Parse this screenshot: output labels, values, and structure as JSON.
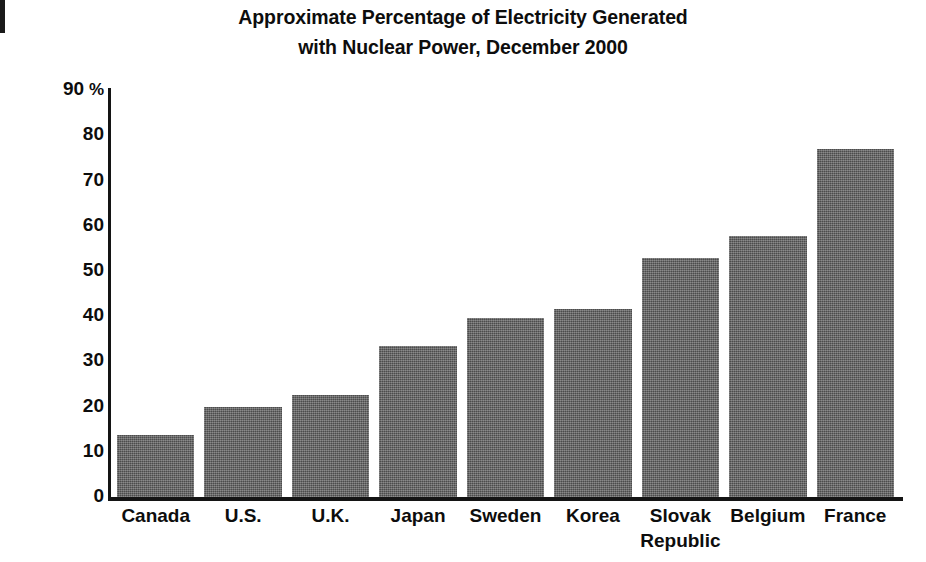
{
  "figure": {
    "title_line1": "Approximate Percentage of Electricity Generated",
    "title_line2": "with Nuclear Power, December 2000",
    "y_axis_unit": "%",
    "bar_color": "#5d5d5d",
    "axis_color": "#141414",
    "background": "#ffffff"
  },
  "chart_data": {
    "type": "bar",
    "title": "Approximate Percentage of Electricity Generated with Nuclear Power, December 2000",
    "xlabel": "",
    "ylabel": "%",
    "ylim": [
      0,
      90
    ],
    "yticks": [
      0,
      10,
      20,
      30,
      40,
      50,
      60,
      70,
      80,
      90
    ],
    "ytick_labels": [
      "0",
      "10",
      "20",
      "30",
      "40",
      "50",
      "60",
      "70",
      "80",
      "90 %"
    ],
    "grid": false,
    "legend": false,
    "categories": [
      "Canada",
      "U.S.",
      "U.K.",
      "Japan",
      "Sweden",
      "Korea",
      "Slovak\nRepublic",
      "Belgium",
      "France"
    ],
    "values": [
      13.7,
      20,
      22.5,
      33.5,
      39.5,
      41.5,
      52.8,
      57.8,
      77
    ]
  }
}
